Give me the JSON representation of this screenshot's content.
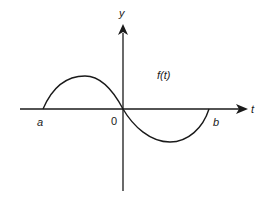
{
  "diagram": {
    "type": "function-plot",
    "colors": {
      "background": "#ffffff",
      "stroke": "#1a1a1a"
    },
    "axes": {
      "horizontal_label": "t",
      "vertical_label": "y",
      "origin_label": "0"
    },
    "points": {
      "left_endpoint_label": "a",
      "right_endpoint_label": "b"
    },
    "curve": {
      "label": "f(t)"
    }
  }
}
